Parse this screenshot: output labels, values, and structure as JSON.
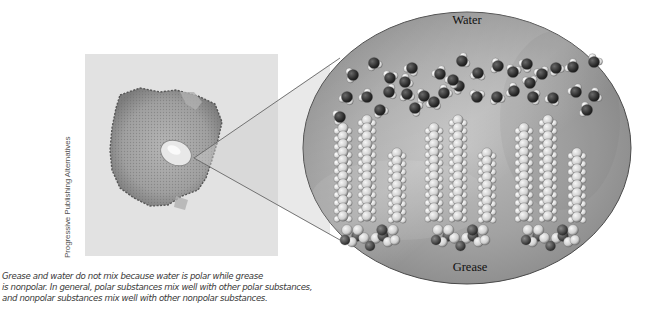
{
  "figure": {
    "photo": {
      "description": "Grease spot photograph",
      "credit": "Progressive Publishing Alternatives"
    },
    "inset": {
      "top_label": "Water",
      "bottom_label": "Grease",
      "water_molecule_count": 36,
      "grease_molecule_count": 3
    },
    "caption": {
      "lines": [
        "Grease and water do not mix because water is polar while grease",
        "is nonpolar. In general, polar substances mix well with other polar substances,",
        "and nonpolar substances mix well with other nonpolar substances."
      ]
    },
    "colors": {
      "background": "#ffffff",
      "inset_fill": "#a8a8a8",
      "oxygen": "#2e2e2e",
      "hydrogen": "#e6e6e6",
      "carbon_chain": "#d9d9d9",
      "text": "#3a3a3a"
    }
  }
}
